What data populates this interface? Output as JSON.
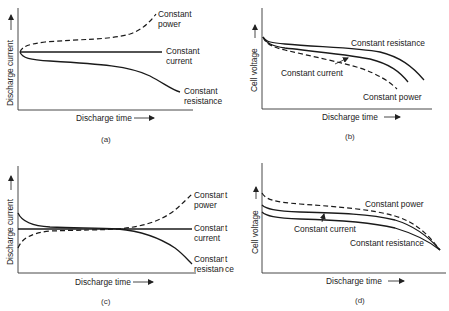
{
  "figure": {
    "panels": [
      {
        "id": "a",
        "caption": "(a)",
        "ylabel": "Discharge current",
        "xlabel": "Discharge time",
        "curves": {
          "constant_power": {
            "label_line1": "Constant",
            "label_line2": "power",
            "style": "dashed"
          },
          "constant_current": {
            "label_line1": "Constant",
            "label_line2": "current",
            "style": "solid"
          },
          "constant_resistance": {
            "label_line1": "Constant",
            "label_line2": "resistance",
            "style": "solid"
          }
        }
      },
      {
        "id": "b",
        "caption": "(b)",
        "ylabel": "Cell voltage",
        "xlabel": "Discharge time",
        "curves": {
          "constant_resistance": {
            "label": "Constant resistance",
            "style": "solid"
          },
          "constant_current": {
            "label": "Constant current",
            "style": "solid"
          },
          "constant_power": {
            "label": "Constant power",
            "style": "dashed"
          }
        }
      },
      {
        "id": "c",
        "caption": "(c)",
        "ylabel": "Discharge current",
        "xlabel": "Discharge time",
        "curves": {
          "constant_power": {
            "label_line1": "Constant",
            "label_line2": "power",
            "style": "dashed"
          },
          "constant_current": {
            "label_line1": "Constant",
            "label_line2": "current",
            "style": "solid"
          },
          "constant_resistance": {
            "label_line1": "Constant",
            "label_line2": "resistance",
            "style": "solid"
          }
        }
      },
      {
        "id": "d",
        "caption": "(d)",
        "ylabel": "Cell voltage",
        "xlabel": "Discharge time",
        "curves": {
          "constant_power": {
            "label": "Constant power",
            "style": "dashed"
          },
          "constant_current": {
            "label": "Constant current",
            "style": "solid"
          },
          "constant_resistance": {
            "label": "Constant resistance",
            "style": "solid"
          }
        }
      }
    ]
  },
  "colors": {
    "line": "#1a1a1a",
    "axis": "#333333",
    "background": "#ffffff"
  }
}
